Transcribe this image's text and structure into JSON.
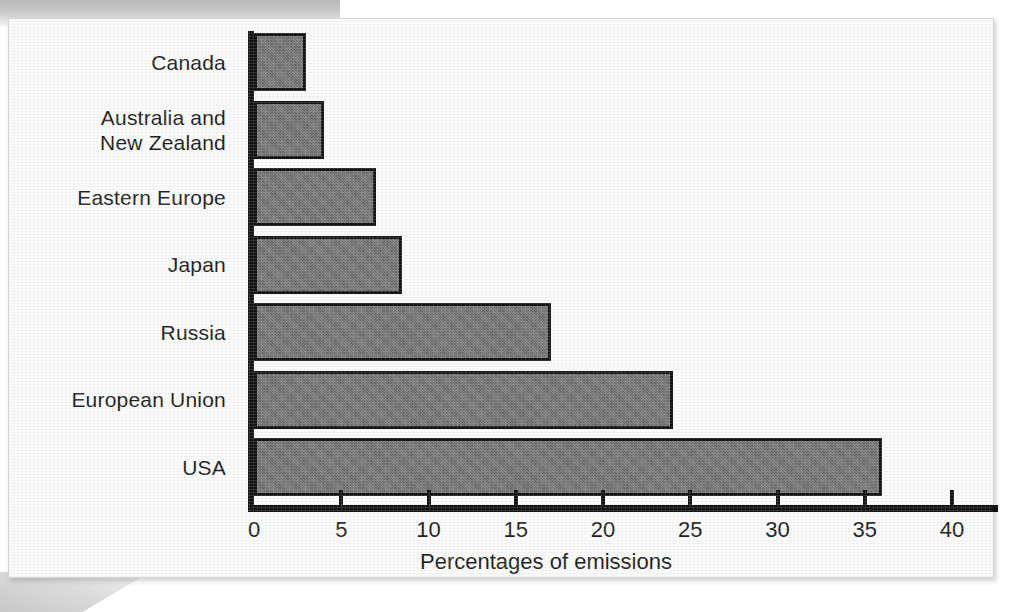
{
  "figure": {
    "background_color": "#fbfbfb",
    "bar_fill_color": "#6f6f6f",
    "bar_edge_color": "#111111",
    "axis_color": "#111111"
  },
  "chart_data": {
    "type": "bar",
    "orientation": "horizontal",
    "title": "",
    "xlabel": "Percentages of emissions",
    "ylabel": "",
    "categories": [
      "Canada",
      "Australia and\nNew Zealand",
      "Eastern Europe",
      "Japan",
      "Russia",
      "European Union",
      "USA"
    ],
    "values": [
      3,
      4,
      7,
      8.5,
      17,
      24,
      36
    ],
    "xlim": [
      0,
      43
    ],
    "ylim": [
      0,
      7
    ],
    "xticks": [
      0,
      5,
      10,
      15,
      20,
      25,
      30,
      35,
      40
    ],
    "xtick_labels": [
      "0",
      "5",
      "10",
      "15",
      "20",
      "25",
      "30",
      "35",
      "40"
    ],
    "grid": false,
    "legend": null,
    "series": [
      {
        "name": "Percentages of emissions",
        "values": [
          3,
          4,
          7,
          8.5,
          17,
          24,
          36
        ]
      }
    ]
  }
}
